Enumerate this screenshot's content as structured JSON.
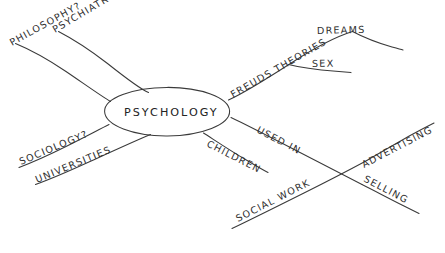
{
  "diagram": {
    "type": "hand-drawn-mind-map",
    "title": "",
    "ink_color": "#3a3a3a",
    "background_color": "#ffffff",
    "center": {
      "label": "PSYCHOLOGY",
      "shape": "ellipse"
    },
    "branches": [
      {
        "id": "psychiatry",
        "label": "PSYCHIATRY?",
        "direction": "upper-left"
      },
      {
        "id": "philosophy",
        "label": "PHILOSOPHY?",
        "direction": "upper-left"
      },
      {
        "id": "freuds",
        "label": "FREUDS THEORIES",
        "direction": "upper-right"
      },
      {
        "id": "dreams",
        "label": "DREAMS",
        "direction": "upper-right-sub"
      },
      {
        "id": "sex",
        "label": "SEX",
        "direction": "upper-right-sub"
      },
      {
        "id": "sociology",
        "label": "SOCIOLOGY?",
        "direction": "lower-left"
      },
      {
        "id": "universities",
        "label": "UNIVERSITIES",
        "direction": "lower-left"
      },
      {
        "id": "children",
        "label": "CHILDREN",
        "direction": "lower-right"
      },
      {
        "id": "used_in",
        "label": "USED IN",
        "direction": "lower-right"
      },
      {
        "id": "social_work",
        "label": "SOCIAL WORK",
        "direction": "lower-right-sub"
      },
      {
        "id": "advertising",
        "label": "ADVERTISING",
        "direction": "lower-right-sub"
      },
      {
        "id": "selling",
        "label": "SELLING",
        "direction": "lower-right-sub"
      }
    ]
  }
}
